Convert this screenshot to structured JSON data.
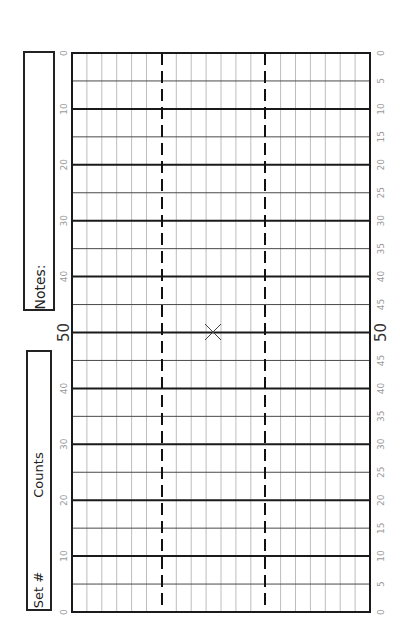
{
  "notes_box": {
    "label": "Notes:"
  },
  "set_box": {
    "set_label": "Set #",
    "counts_label": "Counts"
  },
  "field": {
    "yard_labels_left": [
      "0",
      "10",
      "20",
      "30",
      "40",
      "50",
      "40",
      "30",
      "20",
      "10",
      "0"
    ],
    "yard_labels_right": [
      "0",
      "5",
      "10",
      "15",
      "20",
      "25",
      "30",
      "35",
      "40",
      "45",
      "50",
      "45",
      "40",
      "35",
      "30",
      "25",
      "20",
      "15",
      "10",
      "5",
      "0"
    ],
    "midfield_label": "50",
    "center_marker": "x-mark",
    "hash_lines": "dashed",
    "columns": 20,
    "yard_step": 5
  },
  "colors": {
    "major_line": "#1a1a1a",
    "minor_line": "#4a4a4a",
    "vertical_line": "#bdbdbd",
    "hash_line": "#111111",
    "label_text": "#9a9a9a",
    "midfield_text": "#333333",
    "box_border": "#222222"
  }
}
